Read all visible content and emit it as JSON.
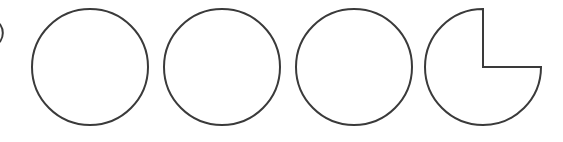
{
  "diagram": {
    "stroke_color": "#3a3a3a",
    "background": "#ffffff",
    "shapes": [
      {
        "type": "partial-arc",
        "label": "cut-off circle at left edge"
      },
      {
        "type": "full-circle",
        "cx": 90,
        "cy": 67,
        "r": 58
      },
      {
        "type": "full-circle",
        "cx": 222,
        "cy": 67,
        "r": 58
      },
      {
        "type": "full-circle",
        "cx": 354,
        "cy": 67,
        "r": 58
      },
      {
        "type": "three-quarter-circle",
        "cx": 483,
        "cy": 67,
        "r": 58,
        "missing_quadrant": "top-right"
      }
    ]
  }
}
